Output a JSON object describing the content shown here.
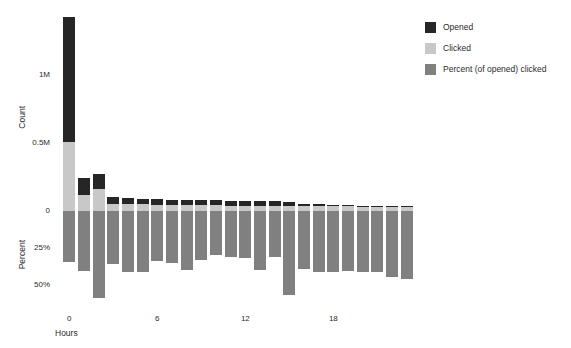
{
  "chart_data": {
    "type": "bar",
    "title": "",
    "subtitle": "",
    "xlabel": "Hours",
    "categories": [
      0,
      1,
      2,
      3,
      4,
      5,
      6,
      7,
      8,
      9,
      10,
      11,
      12,
      13,
      14,
      15,
      16,
      17,
      18,
      19,
      20,
      21,
      22,
      23
    ],
    "xticks": [
      {
        "value": 0,
        "label": "0"
      },
      {
        "value": 6,
        "label": "6"
      },
      {
        "value": 12,
        "label": "12"
      },
      {
        "value": 18,
        "label": "18"
      }
    ],
    "panels": [
      {
        "name": "count-panel",
        "ylabel": "Count",
        "ylim": [
          0,
          1550000
        ],
        "yticks": [
          {
            "value": 0,
            "label": "0"
          },
          {
            "value": 500000,
            "label": "0.5M"
          },
          {
            "value": 1000000,
            "label": "1M"
          }
        ],
        "stacked": true,
        "series": [
          {
            "name": "Clicked",
            "color": "#c8c8c8",
            "values": [
              510000,
              120000,
              165000,
              55000,
              50000,
              48000,
              46000,
              44000,
              44000,
              42000,
              42000,
              40000,
              40000,
              40000,
              38000,
              38000,
              36000,
              36000,
              34000,
              34000,
              32000,
              32000,
              30000,
              28000
            ]
          },
          {
            "name": "Opened",
            "color": "#262626",
            "values": [
              915000,
              125000,
              110000,
              48000,
              44000,
              42000,
              40000,
              38000,
              38000,
              36000,
              36000,
              34000,
              34000,
              32000,
              32000,
              30000,
              18000,
              12000,
              10000,
              9000,
              8000,
              8000,
              7000,
              6000
            ]
          }
        ]
      },
      {
        "name": "percent-panel",
        "ylabel": "Percent",
        "ylim": [
          0,
          60
        ],
        "inverted": true,
        "yticks": [
          {
            "value": 0,
            "label": "0"
          },
          {
            "value": 25,
            "label": "25%"
          },
          {
            "value": 50,
            "label": "50%"
          }
        ],
        "series": [
          {
            "name": "Percent (of opened) clicked",
            "color": "#808080",
            "values": [
              34.5,
              40.5,
              58.5,
              36.0,
              41.0,
              41.0,
              34.0,
              35.0,
              40.0,
              33.0,
              30.0,
              31.0,
              32.0,
              40.0,
              31.0,
              56.5,
              39.0,
              41.0,
              41.0,
              40.5,
              41.0,
              41.5,
              44.5,
              46.0
            ]
          }
        ]
      }
    ],
    "legend": {
      "position": "right",
      "entries": [
        {
          "label": "Opened",
          "color": "#262626",
          "swatch": "legend-swatch-opened"
        },
        {
          "label": "Clicked",
          "color": "#c8c8c8",
          "swatch": "legend-swatch-clicked"
        },
        {
          "label": "Percent (of opened) clicked",
          "color": "#808080",
          "swatch": "legend-swatch-percent"
        }
      ]
    },
    "grid": false,
    "background": "#ffffff"
  }
}
